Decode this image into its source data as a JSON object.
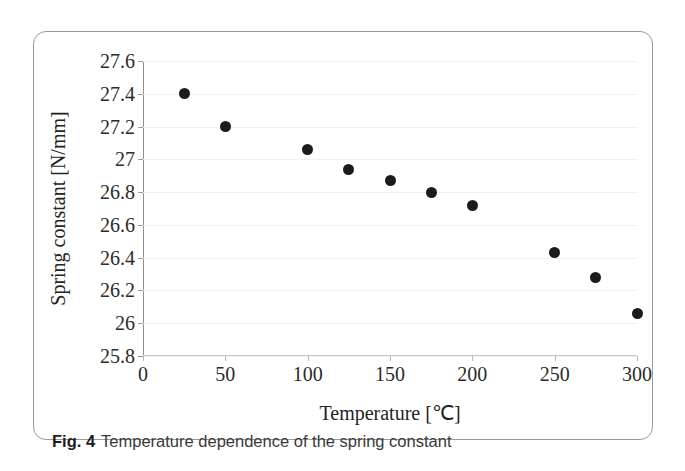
{
  "caption": {
    "label": "Fig. 4",
    "text": "Temperature dependence of the spring constant"
  },
  "chart_data": {
    "type": "scatter",
    "title": "",
    "xlabel": "Temperature [℃]",
    "ylabel": "Spring constant [N/mm]",
    "xlim": [
      0,
      300
    ],
    "ylim": [
      25.8,
      27.6
    ],
    "xticks": [
      0,
      50,
      100,
      150,
      200,
      250,
      300
    ],
    "xtick_labels": [
      "0",
      "50",
      "100",
      "150",
      "200",
      "250",
      "300"
    ],
    "yticks": [
      25.8,
      26,
      26.2,
      26.4,
      26.6,
      26.8,
      27,
      27.2,
      27.4,
      27.6
    ],
    "ytick_labels": [
      "25.8",
      "26",
      "26.2",
      "26.4",
      "26.6",
      "26.8",
      "27",
      "27.2",
      "27.4",
      "27.6"
    ],
    "grid": false,
    "legend": null,
    "marker": "filled-circle",
    "marker_color": "#1b1b1b",
    "x": [
      25,
      50,
      100,
      125,
      150,
      175,
      200,
      250,
      275,
      300
    ],
    "y": [
      27.4,
      27.2,
      27.06,
      26.94,
      26.87,
      26.8,
      26.72,
      26.43,
      26.28,
      26.06
    ],
    "points": [
      {
        "x": 25,
        "y": 27.4
      },
      {
        "x": 50,
        "y": 27.2
      },
      {
        "x": 100,
        "y": 27.06
      },
      {
        "x": 125,
        "y": 26.94
      },
      {
        "x": 150,
        "y": 26.87
      },
      {
        "x": 175,
        "y": 26.8
      },
      {
        "x": 200,
        "y": 26.72
      },
      {
        "x": 250,
        "y": 26.43
      },
      {
        "x": 275,
        "y": 26.28
      },
      {
        "x": 300,
        "y": 26.06
      }
    ]
  }
}
